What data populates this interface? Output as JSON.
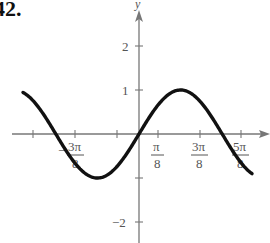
{
  "problem": {
    "number": "42."
  },
  "chart_data": {
    "type": "line",
    "title": "",
    "function": "y = sin(4x)",
    "xlabel": "x",
    "ylabel": "y",
    "x_ticks": [
      {
        "value": "-5π/8",
        "label": ""
      },
      {
        "value": "-3π/8",
        "label": "-3π/8"
      },
      {
        "value": "-π/8",
        "label": ""
      },
      {
        "value": "π/8",
        "label": "π/8"
      },
      {
        "value": "3π/8",
        "label": "3π/8"
      },
      {
        "value": "5π/8",
        "label": "5π/8"
      }
    ],
    "y_ticks": [
      {
        "value": 2,
        "label": "2"
      },
      {
        "value": 1,
        "label": "1"
      },
      {
        "value": -1,
        "label": ""
      },
      {
        "value": -2,
        "label": "-2"
      }
    ],
    "xlim": [
      "-0.74π",
      "0.72π"
    ],
    "ylim": [
      -2.5,
      2.8
    ],
    "series": [
      {
        "name": "y = sin(4x)",
        "points": [
          {
            "x": "-0.74π",
            "y": -0.73
          },
          {
            "x": "-5π/8",
            "y": -1
          },
          {
            "x": "-π/2",
            "y": 0
          },
          {
            "x": "-3π/8",
            "y": 1
          },
          {
            "x": "-π/4",
            "y": 0
          },
          {
            "x": "-π/8",
            "y": -1
          },
          {
            "x": "0",
            "y": 0
          },
          {
            "x": "π/8",
            "y": 1
          },
          {
            "x": "π/4",
            "y": 0
          },
          {
            "x": "3π/8",
            "y": -1
          },
          {
            "x": "π/2",
            "y": 0
          },
          {
            "x": "5π/8",
            "y": 1
          },
          {
            "x": "0.72π",
            "y": 0.72
          }
        ]
      }
    ],
    "grid": false,
    "legend": "none"
  },
  "labels": {
    "y_axis": "y",
    "y_tick_2": "2",
    "y_tick_1": "1",
    "y_tick_neg2": "−2",
    "x_tick_neg3pi8_num": "3π",
    "x_tick_neg3pi8_den": "8",
    "x_tick_neg_sign": "−",
    "x_tick_pi8_num": "π",
    "x_tick_pi8_den": "8",
    "x_tick_3pi8_num": "3π",
    "x_tick_3pi8_den": "8",
    "x_tick_5pi8_num": "5π",
    "x_tick_5pi8_den": "8"
  }
}
